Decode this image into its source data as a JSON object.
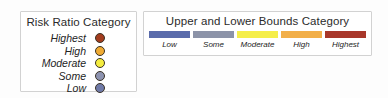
{
  "page": {
    "background": "#fdfdfd",
    "panel_background": "#ffffff",
    "panel_border": "#d2d2d2"
  },
  "risk_panel": {
    "title": "Risk Ratio Category",
    "items": [
      {
        "label": "Highest",
        "color": "#a33c1e"
      },
      {
        "label": "High",
        "color": "#f0ab33"
      },
      {
        "label": "Moderate",
        "color": "#f4ec3f"
      },
      {
        "label": "Some",
        "color": "#8d93b0"
      },
      {
        "label": "Low",
        "color": "#6f7aa8"
      }
    ]
  },
  "bounds_panel": {
    "title": "Upper and Lower Bounds Category",
    "items": [
      {
        "label": "Low",
        "color": "#5a6bab"
      },
      {
        "label": "Some",
        "color": "#8c93a8"
      },
      {
        "label": "Moderate",
        "color": "#f5ee4a"
      },
      {
        "label": "High",
        "color": "#f2af49"
      },
      {
        "label": "Highest",
        "color": "#a8372a"
      }
    ]
  },
  "chart_data": {
    "type": "table",
    "series": [
      {
        "name": "Risk Ratio Category",
        "categories": [
          "Highest",
          "High",
          "Moderate",
          "Some",
          "Low"
        ],
        "colors": [
          "#a33c1e",
          "#f0ab33",
          "#f4ec3f",
          "#8d93b0",
          "#6f7aa8"
        ],
        "marker": "circle"
      },
      {
        "name": "Upper and Lower Bounds Category",
        "categories": [
          "Low",
          "Some",
          "Moderate",
          "High",
          "Highest"
        ],
        "colors": [
          "#5a6bab",
          "#8c93a8",
          "#f5ee4a",
          "#f2af49",
          "#a8372a"
        ],
        "marker": "bar"
      }
    ],
    "xlabel": "",
    "ylabel": "",
    "legend": "standalone"
  }
}
